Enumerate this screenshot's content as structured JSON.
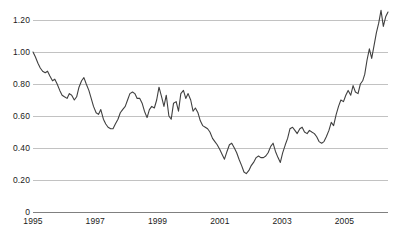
{
  "chart_data": {
    "type": "line",
    "title": "",
    "subtitle": "",
    "xlabel": "",
    "ylabel": "",
    "xlim": [
      1995.0,
      2006.4
    ],
    "ylim": [
      0,
      1.32
    ],
    "grid": true,
    "grid_axis": "y",
    "legend": false,
    "legend_position": "none",
    "line_color": "#404040",
    "grid_color": "#b3b3b3",
    "axis_color": "#808080",
    "background_color": "#ffffff",
    "ytick_labels": [
      "1.20",
      "1.00",
      "0.80",
      "0.60",
      "0.40",
      "0.20",
      "0"
    ],
    "ytick_values": [
      1.2,
      1.0,
      0.8,
      0.6,
      0.4,
      0.2,
      0
    ],
    "xtick_labels": [
      "1995",
      "1997",
      "1999",
      "2001",
      "2003",
      "2005"
    ],
    "xtick_values": [
      1995,
      1997,
      1999,
      2001,
      2003,
      2005
    ],
    "series": [
      {
        "name": "series-1",
        "x": [
          1995.0,
          1995.08,
          1995.17,
          1995.25,
          1995.33,
          1995.42,
          1995.5,
          1995.58,
          1995.67,
          1995.75,
          1995.83,
          1995.92,
          1996.0,
          1996.08,
          1996.17,
          1996.25,
          1996.33,
          1996.42,
          1996.5,
          1996.58,
          1996.67,
          1996.75,
          1996.83,
          1996.92,
          1997.0,
          1997.08,
          1997.17,
          1997.25,
          1997.33,
          1997.42,
          1997.5,
          1997.58,
          1997.67,
          1997.75,
          1997.83,
          1997.92,
          1998.0,
          1998.08,
          1998.17,
          1998.25,
          1998.33,
          1998.42,
          1998.5,
          1998.58,
          1998.67,
          1998.75,
          1998.83,
          1998.92,
          1999.0,
          1999.08,
          1999.17,
          1999.25,
          1999.33,
          1999.42,
          1999.5,
          1999.58,
          1999.67,
          1999.75,
          1999.83,
          1999.92,
          2000.0,
          2000.08,
          2000.17,
          2000.25,
          2000.33,
          2000.42,
          2000.5,
          2000.58,
          2000.67,
          2000.75,
          2000.83,
          2000.92,
          2001.0,
          2001.08,
          2001.17,
          2001.25,
          2001.33,
          2001.42,
          2001.5,
          2001.58,
          2001.67,
          2001.75,
          2001.83,
          2001.92,
          2002.0,
          2002.08,
          2002.17,
          2002.25,
          2002.33,
          2002.42,
          2002.5,
          2002.58,
          2002.67,
          2002.75,
          2002.83,
          2002.92,
          2003.0,
          2003.08,
          2003.17,
          2003.25,
          2003.33,
          2003.42,
          2003.5,
          2003.58,
          2003.67,
          2003.75,
          2003.83,
          2003.92,
          2004.0,
          2004.08,
          2004.17,
          2004.25,
          2004.33,
          2004.42,
          2004.5,
          2004.58,
          2004.67,
          2004.75,
          2004.83,
          2004.92,
          2005.0,
          2005.08,
          2005.17,
          2005.25,
          2005.33,
          2005.42,
          2005.5,
          2005.58,
          2005.67,
          2005.75,
          2005.83,
          2005.92,
          2006.0,
          2006.08,
          2006.17,
          2006.25,
          2006.33
        ],
        "values": [
          1.0,
          0.97,
          0.93,
          0.9,
          0.88,
          0.87,
          0.88,
          0.85,
          0.82,
          0.83,
          0.8,
          0.76,
          0.73,
          0.72,
          0.71,
          0.74,
          0.73,
          0.7,
          0.72,
          0.78,
          0.82,
          0.84,
          0.8,
          0.76,
          0.71,
          0.66,
          0.62,
          0.61,
          0.64,
          0.58,
          0.55,
          0.53,
          0.52,
          0.52,
          0.55,
          0.58,
          0.62,
          0.64,
          0.66,
          0.7,
          0.74,
          0.75,
          0.74,
          0.71,
          0.71,
          0.68,
          0.63,
          0.59,
          0.64,
          0.66,
          0.65,
          0.7,
          0.78,
          0.72,
          0.66,
          0.73,
          0.6,
          0.58,
          0.68,
          0.69,
          0.63,
          0.74,
          0.76,
          0.71,
          0.74,
          0.7,
          0.63,
          0.65,
          0.62,
          0.57,
          0.54,
          0.53,
          0.52,
          0.5,
          0.46,
          0.44,
          0.42,
          0.39,
          0.36,
          0.33,
          0.38,
          0.42,
          0.43,
          0.4,
          0.37,
          0.33,
          0.29,
          0.25,
          0.24,
          0.26,
          0.29,
          0.31,
          0.34,
          0.35,
          0.34,
          0.34,
          0.35,
          0.37,
          0.41,
          0.43,
          0.38,
          0.34,
          0.31,
          0.37,
          0.42,
          0.46,
          0.52,
          0.53,
          0.51,
          0.49,
          0.52,
          0.53,
          0.5,
          0.49,
          0.51,
          0.5,
          0.49,
          0.47,
          0.44,
          0.43,
          0.44,
          0.47,
          0.51,
          0.56,
          0.54,
          0.61,
          0.66,
          0.7,
          0.69,
          0.73,
          0.76,
          0.73,
          0.79,
          0.75,
          0.74,
          0.8,
          0.82
        ]
      }
    ],
    "extra_points": {
      "note": "extended tail through 2006 rise to peak",
      "x": [
        2006.4,
        2006.48,
        2006.56,
        2006.64,
        2006.72,
        2006.8,
        2006.88,
        2006.96,
        2007.04
      ],
      "values": [
        0.86,
        0.95,
        1.02,
        0.96,
        1.04,
        1.12,
        1.18,
        1.26,
        1.16
      ]
    },
    "min_value": 0.24,
    "max_value": 1.26,
    "start_value": 1.0,
    "end_value": 1.25
  },
  "caption": {
    "text": ""
  }
}
